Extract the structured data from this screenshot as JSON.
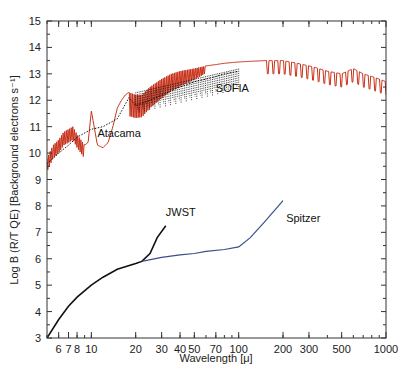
{
  "chart_data": {
    "type": "line",
    "title": "",
    "xlabel": "Wavelength [μ]",
    "ylabel": "Log B (R/T QE) [Background electrons s⁻¹]",
    "xscale": "log",
    "xlim": [
      5,
      1000
    ],
    "ylim": [
      3,
      15
    ],
    "grid": false,
    "legend": "none (inline annotations)",
    "x_tick_labels": [
      "6",
      "7",
      "8",
      "10",
      "20",
      "30",
      "40",
      "50",
      "70",
      "100",
      "200",
      "300",
      "500",
      "1000"
    ],
    "x_ticks": [
      6,
      7,
      8,
      10,
      20,
      30,
      40,
      50,
      70,
      100,
      200,
      300,
      500,
      1000
    ],
    "y_tick_labels": [
      "3",
      "4",
      "5",
      "6",
      "7",
      "8",
      "9",
      "10",
      "11",
      "12",
      "13",
      "14",
      "15"
    ],
    "y_ticks": [
      3,
      4,
      5,
      6,
      7,
      8,
      9,
      10,
      11,
      12,
      13,
      14,
      15
    ],
    "annotations": [
      {
        "text": "Atacama",
        "x": 11,
        "y": 10.6
      },
      {
        "text": "SOFIA",
        "x": 70,
        "y": 12.3
      },
      {
        "text": "JWST",
        "x": 32,
        "y": 7.6
      },
      {
        "text": "Spitzer",
        "x": 210,
        "y": 7.4
      }
    ],
    "series": [
      {
        "name": "Atacama",
        "color": "#c8311a",
        "x": [
          5,
          5.5,
          6,
          6.5,
          7,
          7.5,
          8,
          8.5,
          9,
          9.5,
          10,
          11,
          12,
          13,
          14,
          15,
          16,
          17,
          18,
          20,
          22,
          25,
          30,
          35,
          40,
          50,
          60,
          70,
          80,
          100,
          150,
          200,
          250,
          300,
          350,
          400,
          500,
          600,
          700,
          800,
          900,
          1000
        ],
        "y": [
          9.8,
          10.3,
          10.5,
          10.8,
          10.9,
          11.0,
          10.7,
          10.5,
          10.3,
          10.4,
          11.6,
          10.3,
          10.2,
          10.4,
          11.0,
          11.7,
          12.0,
          12.2,
          12.3,
          12.2,
          12.2,
          12.5,
          12.8,
          13.0,
          13.1,
          13.2,
          13.3,
          13.35,
          13.4,
          13.45,
          13.5,
          13.5,
          13.4,
          13.3,
          13.2,
          13.1,
          13.0,
          13.2,
          13.0,
          12.9,
          12.8,
          12.7
        ]
      },
      {
        "name": "SOFIA",
        "color": "#111111",
        "style": "dotted",
        "x": [
          5,
          6,
          7,
          8,
          10,
          12,
          15,
          18,
          20,
          25,
          30,
          40,
          50,
          60,
          70,
          80,
          100
        ],
        "y": [
          9.6,
          10.0,
          10.3,
          10.6,
          10.9,
          11.0,
          11.3,
          12.1,
          11.8,
          12.0,
          12.2,
          12.5,
          12.7,
          12.8,
          12.9,
          13.0,
          13.1
        ]
      },
      {
        "name": "JWST",
        "color": "#111111",
        "x": [
          5,
          6,
          7,
          8,
          10,
          12,
          15,
          20,
          22,
          25,
          28,
          32
        ],
        "y": [
          3.0,
          3.7,
          4.2,
          4.55,
          5.0,
          5.3,
          5.6,
          5.82,
          5.9,
          6.2,
          6.8,
          7.25
        ]
      },
      {
        "name": "Spitzer",
        "color": "#3a4f8a",
        "x": [
          22,
          30,
          40,
          50,
          60,
          80,
          100,
          120,
          150,
          200
        ],
        "y": [
          5.9,
          6.05,
          6.15,
          6.2,
          6.28,
          6.35,
          6.45,
          6.8,
          7.4,
          8.2
        ]
      }
    ]
  }
}
